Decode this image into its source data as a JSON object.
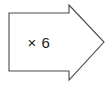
{
  "canvas": {
    "width": 112,
    "height": 86,
    "background_color": "#ffffff"
  },
  "shape": {
    "name": "right-arrow",
    "type": "block-arrow",
    "direction": "right",
    "fill_color": "#ffffff",
    "stroke_color": "#4a4a4a",
    "stroke_width": 1.1,
    "points": "9,13 69,13 69,5 104,42 69,80 69,71 9,71",
    "body": {
      "x": 9,
      "y": 13,
      "width": 60,
      "height": 58
    },
    "head": {
      "tip_x": 104,
      "tip_y": 42,
      "base_x": 69,
      "top_y": 5,
      "bottom_y": 80
    }
  },
  "label": {
    "text": "× 6",
    "operator": "×",
    "value": "6",
    "color": "#1c1c1c",
    "font_size": 15
  }
}
